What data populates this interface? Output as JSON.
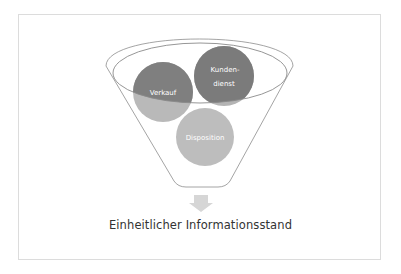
{
  "diagram": {
    "type": "funnel",
    "circles": [
      {
        "label": "Verkauf",
        "lines": [
          "Verkauf"
        ],
        "cx": 163,
        "cy": 92,
        "r": 30,
        "color_dark": "#7f7f7f",
        "color_light": "#b9b9b9"
      },
      {
        "label": "Kundendienst",
        "lines": [
          "Kunden-",
          "dienst"
        ],
        "cx": 224,
        "cy": 76,
        "r": 30,
        "color_dark": "#7b7b7b",
        "color_light": "#b4b4b4"
      },
      {
        "label": "Disposition",
        "lines": [
          "Disposition"
        ],
        "cx": 205,
        "cy": 137,
        "r": 29,
        "color": "#bdbdbd"
      }
    ],
    "arrow": {
      "direction": "down",
      "color": "#d6d6d6"
    },
    "output_label": "Einheitlicher Informationsstand"
  }
}
